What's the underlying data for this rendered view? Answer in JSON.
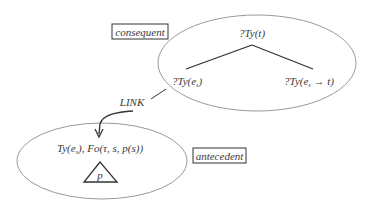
{
  "diagram": {
    "type": "dynamic-syntax-tree-link",
    "colors": {
      "ellipse_stroke": "#9a9a9a",
      "line_stroke": "#333333",
      "text": "#3a3a3a",
      "box_stroke": "#333333",
      "background": "#ffffff"
    },
    "labels": {
      "consequent": "consequent",
      "antecedent": "antecedent",
      "link": "LINK"
    },
    "consequent_tree": {
      "root": {
        "prefix": "?Ty(",
        "var": "t",
        "suffix": ")"
      },
      "left_daughter": {
        "prefix": "?Ty(e",
        "sub": "s",
        "suffix": ")"
      },
      "right_daughter": {
        "prefix": "?Ty(e",
        "sub": "s",
        "arrow": " → t)"
      }
    },
    "antecedent_node": {
      "formula_prefix": "Ty(e",
      "formula_sub": "s",
      "formula_suffix": "), Fo(τ, s, p(s))",
      "subtree_label": "p"
    }
  }
}
